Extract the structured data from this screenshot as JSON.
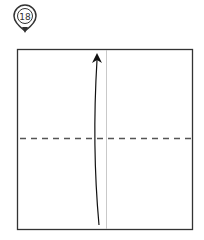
{
  "step": {
    "number": "18",
    "badge_icon": "map-pin-step-marker-icon"
  },
  "diagram": {
    "type": "origami-fold-step",
    "square": {
      "x": 17,
      "y": 49,
      "width": 176,
      "height": 181
    },
    "crease_vertical_x": 106,
    "valley_fold_y": 139,
    "arrow": {
      "direction": "up",
      "from": [
        99,
        225
      ],
      "to": [
        97,
        56
      ]
    },
    "colors": {
      "outline": "#333333",
      "crease": "#bbbbbb",
      "fold_line": "#555555",
      "arrow": "#111111"
    }
  }
}
